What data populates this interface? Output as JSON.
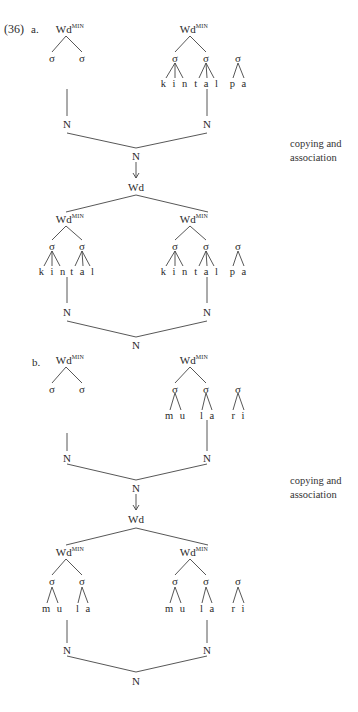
{
  "header": {
    "cropped_text": "…"
  },
  "example": {
    "number": "(36)",
    "a": {
      "label": "a.",
      "top": {
        "left_root": {
          "label": "Wd",
          "sup": "MIN",
          "syllables": [
            "σ",
            "σ"
          ]
        },
        "right_root": {
          "label": "Wd",
          "sup": "MIN",
          "syllables": [
            "σ",
            "σ"
          ],
          "extra_syllable": "σ",
          "segments": [
            "k i n",
            "t a l",
            "p a"
          ]
        },
        "left_N": "N",
        "right_N": "N",
        "merged_N": "N"
      },
      "arrow": "↓",
      "wd": "Wd",
      "note": [
        "copying and",
        "association"
      ],
      "bottom": {
        "left_root": {
          "label": "Wd",
          "sup": "MIN",
          "syllables": [
            "σ",
            "σ"
          ],
          "segments": [
            "k i n",
            "t a l"
          ]
        },
        "right_root": {
          "label": "Wd",
          "sup": "MIN",
          "syllables": [
            "σ",
            "σ"
          ],
          "extra_syllable": "σ",
          "segments": [
            "k i n",
            "t a l",
            "p a"
          ]
        },
        "left_N": "N",
        "right_N": "N",
        "merged_N": "N"
      }
    },
    "b": {
      "label": "b.",
      "top": {
        "left_root": {
          "label": "Wd",
          "sup": "MIN",
          "syllables": [
            "σ",
            "σ"
          ]
        },
        "right_root": {
          "label": "Wd",
          "sup": "MIN",
          "syllables": [
            "σ",
            "σ"
          ],
          "extra_syllable": "σ",
          "segments": [
            "m u",
            "l a",
            "r i"
          ]
        },
        "left_N": "N",
        "right_N": "N",
        "merged_N": "N"
      },
      "arrow": "↓",
      "wd": "Wd",
      "note": [
        "copying and",
        "association"
      ],
      "bottom": {
        "left_root": {
          "label": "Wd",
          "sup": "MIN",
          "syllables": [
            "σ",
            "σ"
          ],
          "segments": [
            "m u",
            "l a"
          ]
        },
        "right_root": {
          "label": "Wd",
          "sup": "MIN",
          "syllables": [
            "σ",
            "σ"
          ],
          "extra_syllable": "σ",
          "segments": [
            "m u",
            "l a",
            "r i"
          ]
        },
        "left_N": "N",
        "right_N": "N",
        "merged_N": "N"
      }
    }
  }
}
